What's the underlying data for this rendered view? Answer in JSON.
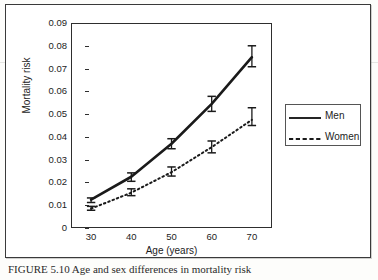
{
  "figure": {
    "caption": "FIGURE 5.10   Age and sex differences in mortality risk",
    "axis": {
      "xlabel": "Age (years)",
      "ylabel": "Mortality risk"
    }
  },
  "legend": {
    "position": "right",
    "entries": [
      {
        "label": "Men",
        "style": "solid"
      },
      {
        "label": "Women",
        "style": "dashed"
      }
    ]
  },
  "chart_data": {
    "type": "line",
    "title": "",
    "xlabel": "Age (years)",
    "ylabel": "Mortality risk",
    "x": [
      30,
      40,
      50,
      60,
      70
    ],
    "xticklabels": [
      "30",
      "40",
      "50",
      "60",
      "70"
    ],
    "xlim": [
      25,
      75
    ],
    "ylim": [
      0,
      0.09
    ],
    "yticks": [
      0,
      0.01,
      0.02,
      0.03,
      0.04,
      0.05,
      0.06,
      0.07,
      0.08,
      0.09
    ],
    "yticklabels": [
      "0",
      "0.01",
      "0.02",
      "0.03",
      "0.04",
      "0.05",
      "0.06",
      "0.07",
      "0.08",
      "0.09"
    ],
    "grid": false,
    "error_bars": true,
    "legend_position": "right",
    "series": [
      {
        "name": "Men",
        "style": "solid",
        "color": "#1a1a1a",
        "values": [
          0.0125,
          0.0225,
          0.037,
          0.0545,
          0.075
        ],
        "err_low": [
          0.0112,
          0.0205,
          0.0348,
          0.0512,
          0.0708
        ],
        "err_high": [
          0.0132,
          0.0242,
          0.0392,
          0.0578,
          0.08
        ]
      },
      {
        "name": "Women",
        "style": "dashed",
        "color": "#1a1a1a",
        "values": [
          0.0085,
          0.0155,
          0.0245,
          0.0355,
          0.0475
        ],
        "err_low": [
          0.0078,
          0.0142,
          0.0228,
          0.033,
          0.045
        ],
        "err_high": [
          0.0095,
          0.0172,
          0.0268,
          0.0382,
          0.0528
        ]
      }
    ]
  }
}
